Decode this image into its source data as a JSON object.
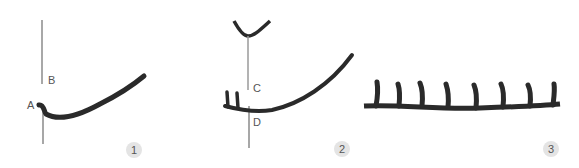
{
  "figure": {
    "panels": [
      {
        "step": "1",
        "labels": {
          "a": "A",
          "b": "B"
        }
      },
      {
        "step": "2",
        "labels": {
          "c": "C",
          "d": "D"
        }
      },
      {
        "step": "3"
      }
    ],
    "colors": {
      "yarn": "#2a2a2a",
      "hook": "#9a9a9a",
      "badge_bg": "#e4e4e4",
      "text": "#555555"
    }
  }
}
